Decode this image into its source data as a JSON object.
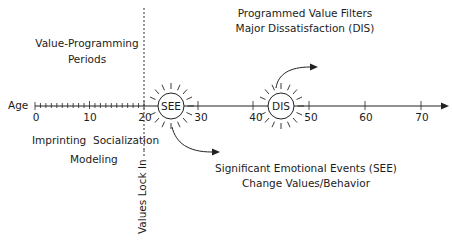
{
  "diagram": {
    "axis": {
      "label": "Age",
      "ticks": [
        "0",
        "10",
        "20",
        "30",
        "40",
        "50",
        "60",
        "70"
      ]
    },
    "periods_title": {
      "line1": "Value-Programming",
      "line2": "Periods"
    },
    "stages": {
      "imprinting": "Imprinting",
      "socialization": "Socialization",
      "modeling": "Modeling"
    },
    "lock_in": "Values Lock In",
    "see": {
      "label": "SEE",
      "caption_line1": "Significant Emotional Events (SEE)",
      "caption_line2": "Change Values/Behavior"
    },
    "dis": {
      "label": "DIS",
      "caption_line1": "Programmed Value Filters",
      "caption_line2": "Major Dissatisfaction (DIS)"
    }
  }
}
